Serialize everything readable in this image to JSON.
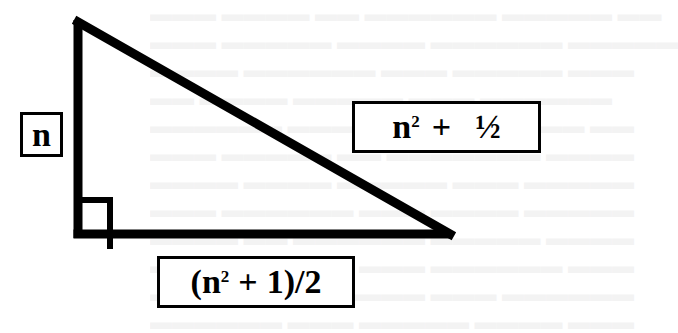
{
  "figure": {
    "type": "right-triangle",
    "stroke_color": "#000000",
    "background_color": "#ffffff"
  },
  "labels": {
    "vertical_leg": {
      "text": "n"
    },
    "hypotenuse": {
      "base": "n",
      "exponent": "2",
      "operator": "+",
      "term": "½",
      "full_text": "n² + ½"
    },
    "horizontal_leg": {
      "open_paren": "(",
      "base": "n",
      "exponent": "2",
      "operator": "+",
      "term": "1)/2",
      "full_text": "(n² + 1)/2"
    }
  },
  "right_angle_marker": {
    "present": true
  }
}
